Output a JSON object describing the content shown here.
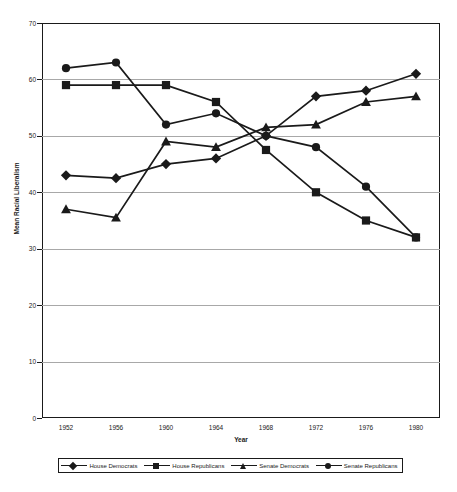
{
  "chart_data": {
    "type": "line",
    "title": "",
    "xlabel": "Year",
    "ylabel": "Mean Racial Liberalism",
    "x": [
      1952,
      1956,
      1960,
      1964,
      1968,
      1972,
      1976,
      1980
    ],
    "categories": [
      "1952",
      "1956",
      "1960",
      "1964",
      "1968",
      "1972",
      "1976",
      "1980"
    ],
    "xlim": [
      1950,
      1982
    ],
    "ylim": [
      0,
      70
    ],
    "yticks": [
      0,
      10,
      20,
      30,
      40,
      50,
      60,
      70
    ],
    "ytick_labels": [
      "0",
      "10",
      "20",
      "30",
      "40",
      "50",
      "60",
      "70"
    ],
    "grid": "horizontal",
    "legend_position": "bottom",
    "series": [
      {
        "name": "House Democrats",
        "marker": "diamond",
        "color": "#1a1a1a",
        "values": [
          43,
          42.5,
          45,
          46,
          50,
          57,
          58,
          61
        ]
      },
      {
        "name": "House Republicans",
        "marker": "square",
        "color": "#1a1a1a",
        "values": [
          59,
          59,
          59,
          56,
          47.5,
          40,
          35,
          32
        ]
      },
      {
        "name": "Senate Democrats",
        "marker": "triangle",
        "color": "#1a1a1a",
        "values": [
          37,
          35.5,
          49,
          48,
          51.5,
          52,
          56,
          57
        ]
      },
      {
        "name": "Senate Republicans",
        "marker": "circle",
        "color": "#1a1a1a",
        "values": [
          62,
          63,
          52,
          54,
          50,
          48,
          41,
          32
        ]
      }
    ]
  },
  "axes": {
    "ylabel": "Mean Racial Liberalism",
    "xlabel": "Year"
  },
  "legend": {
    "items": [
      {
        "label": "House Democrats",
        "marker": "diamond"
      },
      {
        "label": "House Republicans",
        "marker": "square"
      },
      {
        "label": "Senate Democrats",
        "marker": "triangle"
      },
      {
        "label": "Senate Republicans",
        "marker": "circle"
      }
    ]
  },
  "colors": {
    "ink": "#1a1a1a",
    "grid": "#a8a8a8",
    "background": "#ffffff"
  }
}
